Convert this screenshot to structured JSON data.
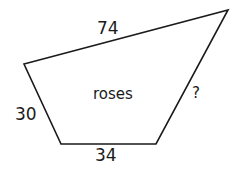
{
  "figure": {
    "shape": "quadrilateral",
    "region_label": "roses",
    "sides": {
      "top": "74",
      "left": "30",
      "bottom": "34",
      "right": "?"
    },
    "stroke_color": "#1a1a1a"
  }
}
